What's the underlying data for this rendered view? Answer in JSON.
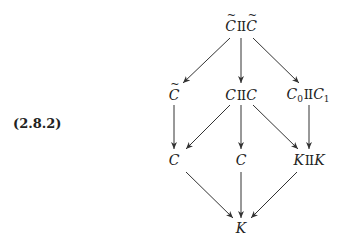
{
  "equation_label": "(2.8.2)",
  "nodes": {
    "top": {
      "left": "C",
      "op": "II",
      "right": "C",
      "tilde_left": true,
      "tilde_right": true,
      "x": 241,
      "y": 26
    },
    "row2_left": {
      "text": "C",
      "tilde": true,
      "x": 174,
      "y": 95
    },
    "row2_mid": {
      "left": "C",
      "op": "II",
      "right": "C",
      "x": 241,
      "y": 95
    },
    "row2_right": {
      "left": "C",
      "left_sub": "0",
      "op": "II",
      "right": "C",
      "right_sub": "1",
      "x": 308,
      "y": 95
    },
    "row3_left": {
      "text": "C",
      "x": 174,
      "y": 160
    },
    "row3_mid": {
      "text": "C",
      "x": 241,
      "y": 160
    },
    "row3_right": {
      "left": "K",
      "op": "II",
      "right": "K",
      "x": 309,
      "y": 160
    },
    "bottom": {
      "text": "K",
      "x": 241,
      "y": 228
    }
  },
  "arrows": [
    {
      "from": "top",
      "to": "row2_left",
      "x1": 230,
      "y1": 38,
      "x2": 183,
      "y2": 83
    },
    {
      "from": "top",
      "to": "row2_mid",
      "x1": 241,
      "y1": 38,
      "x2": 241,
      "y2": 83
    },
    {
      "from": "top",
      "to": "row2_right",
      "x1": 253,
      "y1": 38,
      "x2": 299,
      "y2": 83
    },
    {
      "from": "row2_left",
      "to": "row3_left",
      "x1": 174,
      "y1": 105,
      "x2": 174,
      "y2": 149
    },
    {
      "from": "row2_mid",
      "to": "row3_left",
      "x1": 230,
      "y1": 105,
      "x2": 186,
      "y2": 149
    },
    {
      "from": "row2_mid",
      "to": "row3_mid",
      "x1": 241,
      "y1": 105,
      "x2": 241,
      "y2": 149
    },
    {
      "from": "row2_mid",
      "to": "row3_right",
      "x1": 253,
      "y1": 105,
      "x2": 298,
      "y2": 149
    },
    {
      "from": "row2_right",
      "to": "row3_right",
      "x1": 309,
      "y1": 105,
      "x2": 309,
      "y2": 149
    },
    {
      "from": "row3_left",
      "to": "bottom",
      "x1": 186,
      "y1": 172,
      "x2": 233,
      "y2": 218
    },
    {
      "from": "row3_mid",
      "to": "bottom",
      "x1": 241,
      "y1": 172,
      "x2": 241,
      "y2": 218
    },
    {
      "from": "row3_right",
      "to": "bottom",
      "x1": 297,
      "y1": 172,
      "x2": 251,
      "y2": 218
    }
  ],
  "colors": {
    "ink": "#333333",
    "background": "#ffffff"
  }
}
